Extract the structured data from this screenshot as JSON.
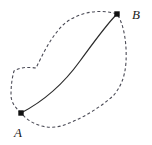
{
  "figure": {
    "type": "path-diagram",
    "background_color": "#ffffff",
    "canvas": {
      "width": 152,
      "height": 145
    },
    "points": [
      {
        "id": "A",
        "label": "A",
        "marker": "filled-square",
        "x": 21,
        "y": 113,
        "label_x": 14,
        "label_y": 126
      },
      {
        "id": "B",
        "label": "B",
        "marker": "filled-square",
        "x": 117,
        "y": 14,
        "label_x": 132,
        "label_y": 8
      }
    ],
    "curves": [
      {
        "id": "solid-path",
        "name": "solid-curve-A-to-B",
        "style": "solid",
        "color": "#2b2b2b",
        "width": 1.2,
        "path": "M 21 113 C 44 101 62 86 80 61 C 94 42 106 25 117 14"
      },
      {
        "id": "dashed-loop",
        "name": "dashed-closed-region-boundary",
        "style": "dashed",
        "color": "#4a4a55",
        "width": 1.1,
        "dash": "3 2.4",
        "path": "M 21 113 C 16 108 11 103 11 95 C 11 86 12 78 14 71 C 20 67 28 67 36 68 C 42 56 50 38 63 25 C 76 13 98 8 117 14 C 124 24 127 44 126 62 C 125 78 120 88 113 96 C 98 109 80 120 61 126 C 46 130 30 124 21 113 Z"
      }
    ]
  }
}
